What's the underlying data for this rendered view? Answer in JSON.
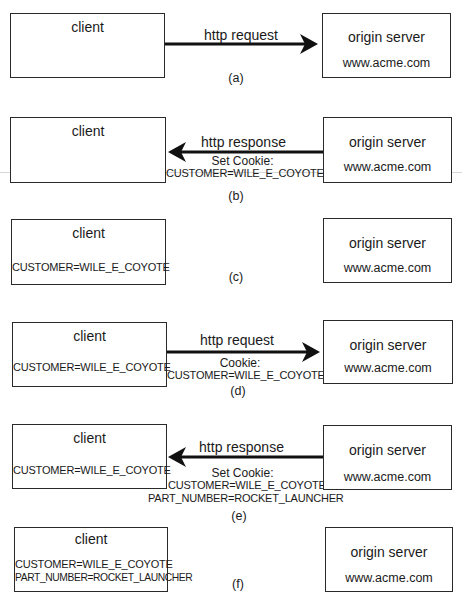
{
  "panels": [
    {
      "id": "a",
      "caption": "(a)",
      "client": {
        "title": "client",
        "cookies": []
      },
      "server": {
        "title": "origin server",
        "host": "www.acme.com"
      },
      "arrow": {
        "direction": "right",
        "label": "http request",
        "sublabels": []
      }
    },
    {
      "id": "b",
      "caption": "(b)",
      "client": {
        "title": "client",
        "cookies": []
      },
      "server": {
        "title": "origin server",
        "host": "www.acme.com"
      },
      "arrow": {
        "direction": "left",
        "label": "http response",
        "sublabels": [
          "Set Cookie:",
          "CUSTOMER=WILE_E_COYOTE"
        ]
      }
    },
    {
      "id": "c",
      "caption": "(c)",
      "client": {
        "title": "client",
        "cookies": [
          "CUSTOMER=WILE_E_COYOTE"
        ]
      },
      "server": {
        "title": "origin server",
        "host": "www.acme.com"
      },
      "arrow": null
    },
    {
      "id": "d",
      "caption": "(d)",
      "client": {
        "title": "client",
        "cookies": [
          "CUSTOMER=WILE_E_COYOTE"
        ]
      },
      "server": {
        "title": "origin server",
        "host": "www.acme.com"
      },
      "arrow": {
        "direction": "right",
        "label": "http request",
        "sublabels": [
          "Cookie:",
          "CUSTOMER=WILE_E_COYOTE"
        ]
      }
    },
    {
      "id": "e",
      "caption": "(e)",
      "client": {
        "title": "client",
        "cookies": [
          "CUSTOMER=WILE_E_COYOTE"
        ]
      },
      "server": {
        "title": "origin server",
        "host": "www.acme.com"
      },
      "arrow": {
        "direction": "left",
        "label": "http response",
        "sublabels": [
          "Set Cookie:",
          "CUSTOMER=WILE_E_COYOTE",
          "PART_NUMBER=ROCKET_LAUNCHER"
        ]
      }
    },
    {
      "id": "f",
      "caption": "(f)",
      "client": {
        "title": "client",
        "cookies": [
          "CUSTOMER=WILE_E_COYOTE",
          "PART_NUMBER=ROCKET_LAUNCHER"
        ]
      },
      "server": {
        "title": "origin server",
        "host": "www.acme.com"
      },
      "arrow": null
    }
  ]
}
